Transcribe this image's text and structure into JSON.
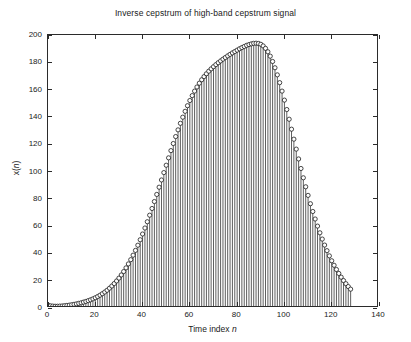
{
  "chart_data": {
    "type": "bar",
    "render_style": "stem-plot-with-circle-markers",
    "title": "Inverse cepstrum of high-band cepstrum signal",
    "xlabel": "Time index n",
    "ylabel": "x(n)",
    "xlim": [
      0,
      140
    ],
    "ylim": [
      0,
      200
    ],
    "xticks": [
      0,
      20,
      40,
      60,
      80,
      100,
      120,
      140
    ],
    "yticks": [
      0,
      20,
      40,
      60,
      80,
      100,
      120,
      140,
      160,
      180,
      200
    ],
    "grid": false,
    "legend": null,
    "series_color": "#1a1a1a",
    "marker": "circle-open",
    "x": [
      0,
      1,
      2,
      3,
      4,
      5,
      6,
      7,
      8,
      9,
      10,
      11,
      12,
      13,
      14,
      15,
      16,
      17,
      18,
      19,
      20,
      21,
      22,
      23,
      24,
      25,
      26,
      27,
      28,
      29,
      30,
      31,
      32,
      33,
      34,
      35,
      36,
      37,
      38,
      39,
      40,
      41,
      42,
      43,
      44,
      45,
      46,
      47,
      48,
      49,
      50,
      51,
      52,
      53,
      54,
      55,
      56,
      57,
      58,
      59,
      60,
      61,
      62,
      63,
      64,
      65,
      66,
      67,
      68,
      69,
      70,
      71,
      72,
      73,
      74,
      75,
      76,
      77,
      78,
      79,
      80,
      81,
      82,
      83,
      84,
      85,
      86,
      87,
      88,
      89,
      90,
      91,
      92,
      93,
      94,
      95,
      96,
      97,
      98,
      99,
      100,
      101,
      102,
      103,
      104,
      105,
      106,
      107,
      108,
      109,
      110,
      111,
      112,
      113,
      114,
      115,
      116,
      117,
      118,
      119,
      120,
      121,
      122,
      123,
      124,
      125,
      126,
      127,
      128
    ],
    "values": [
      2.0,
      1.6,
      1.4,
      1.3,
      1.3,
      1.4,
      1.5,
      1.7,
      1.9,
      2.1,
      2.4,
      2.7,
      3.0,
      3.4,
      3.8,
      4.3,
      4.8,
      5.4,
      6.0,
      6.7,
      7.5,
      8.4,
      9.4,
      10.5,
      11.7,
      13.0,
      14.5,
      16.1,
      17.9,
      19.8,
      21.9,
      24.2,
      26.7,
      29.4,
      32.3,
      35.4,
      38.7,
      42.2,
      46.0,
      50.0,
      54.2,
      58.6,
      63.2,
      68.0,
      72.9,
      78.0,
      83.2,
      88.5,
      93.8,
      99.2,
      104.6,
      110.0,
      115.3,
      120.5,
      125.6,
      130.5,
      135.3,
      139.8,
      144.1,
      148.2,
      152.0,
      155.6,
      158.9,
      161.9,
      164.7,
      167.2,
      169.5,
      171.6,
      173.5,
      175.2,
      176.8,
      178.3,
      179.7,
      181.0,
      182.3,
      183.5,
      184.7,
      185.8,
      186.9,
      187.9,
      188.9,
      189.9,
      190.8,
      191.6,
      192.4,
      193.0,
      193.5,
      193.9,
      194.0,
      193.8,
      193.2,
      192.0,
      190.2,
      187.7,
      184.5,
      180.6,
      176.0,
      170.8,
      165.1,
      158.9,
      152.3,
      145.4,
      138.3,
      131.0,
      123.7,
      116.4,
      109.2,
      102.2,
      95.4,
      88.8,
      82.5,
      76.4,
      70.7,
      65.2,
      60.0,
      55.1,
      50.5,
      46.1,
      42.0,
      38.2,
      34.6,
      31.3,
      28.2,
      25.3,
      22.6,
      20.1,
      17.8,
      15.7,
      13.8
    ],
    "peak": {
      "n": 88,
      "value": 194
    }
  }
}
